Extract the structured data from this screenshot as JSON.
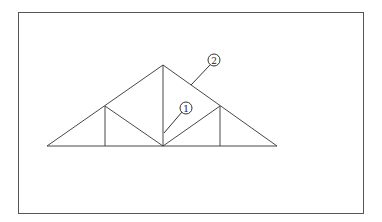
{
  "diagram": {
    "type": "roof-truss",
    "frame": {
      "x": 18,
      "y": 12,
      "width": 345,
      "height": 201
    },
    "colors": {
      "line": "#333333",
      "frame": "#555555",
      "background": "#ffffff"
    },
    "nodes": {
      "left_support": [
        47,
        146
      ],
      "right_support": [
        277,
        146
      ],
      "apex": [
        163,
        65
      ],
      "left_panel_point": [
        105,
        106
      ],
      "right_panel_point": [
        220,
        106
      ],
      "center_bottom": [
        163,
        146
      ],
      "left_bottom_post": [
        105,
        146
      ],
      "right_bottom_post": [
        220,
        146
      ]
    },
    "callouts": [
      {
        "label": "1",
        "cx": 186,
        "cy": 108,
        "r": 6,
        "leader_to": [
          164,
          133
        ],
        "target": "king post / center vertical member"
      },
      {
        "label": "2",
        "cx": 214,
        "cy": 60,
        "r": 6,
        "leader_to": [
          191,
          85
        ],
        "target": "top chord (rafter)"
      }
    ]
  }
}
